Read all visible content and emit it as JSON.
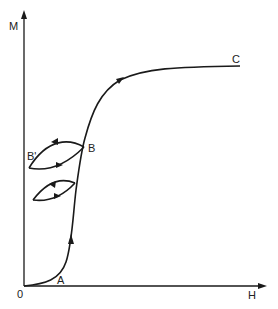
{
  "diagram": {
    "type": "magnetization-curve",
    "axes": {
      "y_label": "M",
      "x_label": "H",
      "origin_label": "0"
    },
    "points": {
      "A": "A",
      "B": "B",
      "B_prime": "B'",
      "C": "C"
    },
    "colors": {
      "line": "#1a1a1a",
      "background": "#ffffff"
    }
  }
}
